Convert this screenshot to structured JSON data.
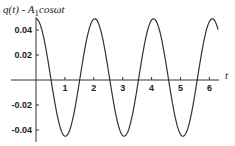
{
  "chart_data": {
    "type": "line",
    "title_parts": {
      "q": "q(t) - A",
      "sub": "1",
      "rest": "cosωt"
    },
    "xlabel": "t",
    "ylabel": "",
    "xlim": [
      0,
      6.3
    ],
    "ylim": [
      -0.046,
      0.05
    ],
    "xticks": [
      1,
      2,
      3,
      4,
      5,
      6
    ],
    "xtick_labels": [
      "1",
      "2",
      "3",
      "4",
      "5",
      "6"
    ],
    "yticks": [
      0.04,
      0.02,
      -0.02,
      -0.04
    ],
    "ytick_labels": [
      "0.04",
      "0.02",
      "-0.02",
      "-0.04"
    ],
    "grid": false,
    "series": [
      {
        "name": "q(t) - A1 cos wt",
        "function": "offset + amplitude*cos(omega*t)",
        "amplitude": 0.047,
        "offset": 0.002,
        "omega": 3.09,
        "t_range": [
          0,
          6.3
        ],
        "color": "#333333",
        "points": [
          [
            0.0,
            0.049
          ],
          [
            0.5,
            0.0023
          ],
          [
            1.02,
            -0.045
          ],
          [
            1.5,
            0.0003
          ],
          [
            2.03,
            0.049
          ],
          [
            2.55,
            0.0005
          ],
          [
            3.05,
            -0.045
          ],
          [
            3.55,
            0.002
          ],
          [
            4.07,
            0.049
          ],
          [
            4.6,
            0.0
          ],
          [
            5.08,
            -0.045
          ],
          [
            5.6,
            0.003
          ],
          [
            6.1,
            0.049
          ]
        ]
      }
    ]
  }
}
